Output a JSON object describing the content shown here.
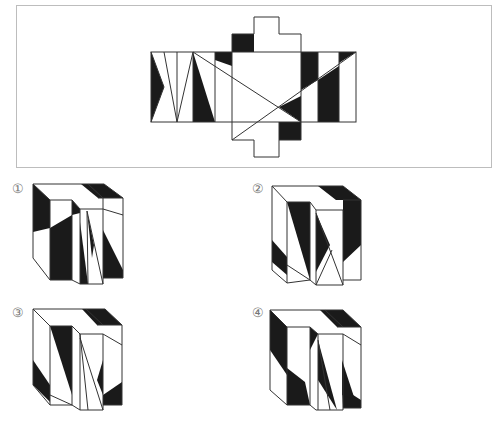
{
  "figure": {
    "type": "cube-net-folding-puzzle",
    "net": {
      "description": "Unfolded net of a stepped block with black/white triangular patterns"
    },
    "options": [
      {
        "id": 1,
        "label": "①"
      },
      {
        "id": 2,
        "label": "②"
      },
      {
        "id": 3,
        "label": "③"
      },
      {
        "id": 4,
        "label": "④"
      }
    ],
    "colors": {
      "fill": "#1a1a1a",
      "stroke": "#333333",
      "frame": "#bdbdbd"
    }
  }
}
